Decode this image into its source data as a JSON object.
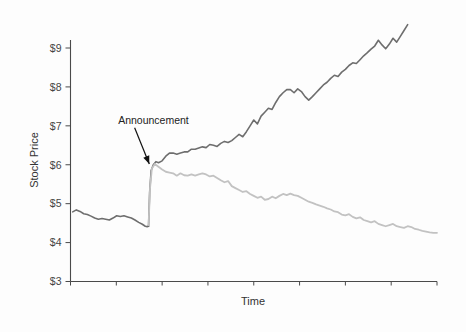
{
  "chart_data": {
    "type": "line",
    "title": "",
    "subtitle": "",
    "xlabel": "Time",
    "ylabel": "Stock Price",
    "ylim": [
      3,
      9.7
    ],
    "xlim": [
      0,
      100
    ],
    "grid": false,
    "legend_position": "none",
    "y_tick_labels": [
      "$3",
      "$4",
      "$5",
      "$6",
      "$7",
      "$8",
      "$9"
    ],
    "y_tick_values": [
      3,
      4,
      5,
      6,
      7,
      8,
      9
    ],
    "x_tick_labels": [
      "",
      "",
      "",
      "",
      "",
      "",
      "",
      "",
      ""
    ],
    "x_tick_values": [
      0,
      12.5,
      25,
      37.5,
      50,
      62.5,
      75,
      87.5,
      100
    ],
    "annotations": [
      {
        "text": "Announcement",
        "text_x": 13.0,
        "text_y": 7.05,
        "arrow_from_x": 17.5,
        "arrow_from_y": 6.95,
        "arrow_to_x": 21.5,
        "arrow_to_y": 6.02
      }
    ],
    "series": [
      {
        "name": "pre-announcement",
        "color": "#6e6e6e",
        "width": 1.6,
        "x": [
          0.6,
          1.6,
          2.6,
          3.6,
          4.6,
          5.6,
          6.6,
          7.6,
          8.6,
          9.6,
          10.6,
          11.6,
          12.6,
          13.6,
          14.6,
          15.6,
          16.6,
          17.6,
          18.6,
          19.6,
          20.4,
          20.9,
          21.3
        ],
        "values": [
          4.79,
          4.84,
          4.8,
          4.74,
          4.72,
          4.68,
          4.63,
          4.6,
          4.62,
          4.6,
          4.58,
          4.63,
          4.69,
          4.67,
          4.69,
          4.66,
          4.63,
          4.58,
          4.52,
          4.47,
          4.42,
          4.41,
          4.42
        ]
      },
      {
        "name": "post-announcement-upper",
        "color": "#6e6e6e",
        "width": 1.6,
        "x": [
          21.3,
          21.6,
          22.0,
          22.6,
          23.3,
          24.0,
          25.0,
          26.0,
          27.0,
          28.0,
          29.0,
          30.0,
          31.0,
          32.0,
          33.0,
          34.0,
          35.0,
          36.0,
          37.0,
          38.0,
          39.0,
          40.0,
          41.0,
          42.0,
          43.0,
          44.0,
          45.0,
          46.0,
          47.0,
          48.0,
          49.0,
          50.0,
          51.0,
          52.0,
          53.0,
          54.0,
          55.0,
          56.0,
          57.0,
          58.0,
          59.0,
          60.0,
          61.0,
          62.0,
          63.0,
          64.0,
          65.0,
          66.0,
          67.0,
          68.0,
          69.0,
          70.0,
          71.0,
          72.0,
          73.0,
          74.0,
          75.0,
          76.0,
          77.0,
          78.0,
          79.0,
          80.0,
          81.0,
          82.0,
          83.0,
          84.0,
          85.0,
          86.0,
          87.0,
          88.0,
          89.0,
          90.0,
          91.0,
          92.0
        ],
        "values": [
          4.42,
          5.3,
          5.85,
          6.0,
          6.08,
          6.05,
          6.1,
          6.22,
          6.3,
          6.3,
          6.27,
          6.3,
          6.33,
          6.33,
          6.4,
          6.4,
          6.43,
          6.46,
          6.44,
          6.52,
          6.5,
          6.47,
          6.55,
          6.6,
          6.57,
          6.62,
          6.7,
          6.78,
          6.72,
          6.85,
          7.0,
          7.15,
          7.05,
          7.25,
          7.35,
          7.45,
          7.42,
          7.6,
          7.75,
          7.85,
          7.93,
          7.93,
          7.85,
          7.95,
          7.88,
          7.75,
          7.66,
          7.75,
          7.85,
          7.95,
          8.05,
          8.12,
          8.22,
          8.3,
          8.27,
          8.38,
          8.45,
          8.55,
          8.62,
          8.6,
          8.7,
          8.8,
          8.88,
          8.97,
          9.05,
          9.2,
          9.08,
          8.98,
          9.1,
          9.25,
          9.15,
          9.3,
          9.45,
          9.6
        ]
      },
      {
        "name": "post-announcement-lower",
        "color": "#c2c2c2",
        "width": 1.8,
        "x": [
          21.3,
          21.7,
          22.2,
          23.0,
          24.0,
          25.0,
          26.0,
          27.0,
          28.0,
          29.0,
          30.0,
          31.0,
          32.0,
          33.0,
          34.0,
          35.0,
          36.0,
          37.0,
          38.0,
          39.0,
          40.0,
          41.0,
          42.0,
          43.0,
          44.0,
          45.0,
          46.0,
          47.0,
          48.0,
          49.0,
          50.0,
          51.0,
          52.0,
          53.0,
          54.0,
          55.0,
          56.0,
          57.0,
          58.0,
          59.0,
          60.0,
          61.0,
          62.0,
          63.0,
          64.0,
          65.0,
          66.0,
          67.0,
          68.0,
          69.0,
          70.0,
          71.0,
          72.0,
          73.0,
          74.0,
          75.0,
          76.0,
          77.0,
          78.0,
          79.0,
          80.0,
          81.0,
          82.0,
          83.0,
          84.0,
          85.0,
          86.0,
          87.0,
          88.0,
          89.0,
          90.0,
          91.0,
          92.0,
          93.0,
          94.0,
          95.0,
          96.0,
          97.0,
          98.0,
          99.0,
          100.0
        ],
        "values": [
          4.45,
          5.4,
          5.9,
          6.02,
          5.95,
          5.88,
          5.82,
          5.8,
          5.78,
          5.72,
          5.78,
          5.73,
          5.72,
          5.75,
          5.72,
          5.75,
          5.78,
          5.75,
          5.7,
          5.72,
          5.66,
          5.6,
          5.55,
          5.58,
          5.45,
          5.4,
          5.35,
          5.3,
          5.32,
          5.25,
          5.2,
          5.15,
          5.18,
          5.1,
          5.12,
          5.18,
          5.14,
          5.2,
          5.25,
          5.22,
          5.26,
          5.22,
          5.2,
          5.15,
          5.1,
          5.05,
          5.02,
          4.98,
          4.95,
          4.92,
          4.88,
          4.85,
          4.8,
          4.78,
          4.72,
          4.7,
          4.73,
          4.66,
          4.62,
          4.65,
          4.58,
          4.55,
          4.52,
          4.55,
          4.48,
          4.45,
          4.42,
          4.45,
          4.48,
          4.42,
          4.4,
          4.38,
          4.42,
          4.4,
          4.35,
          4.33,
          4.3,
          4.28,
          4.26,
          4.25,
          4.25
        ]
      }
    ]
  },
  "axes": {
    "y_axis_name": "Stock Price",
    "x_axis_name": "Time"
  },
  "colors": {
    "dark_line": "#6e6e6e",
    "light_line": "#c2c2c2",
    "axis": "#4a4a4a",
    "text": "#333333",
    "background": "#fdfdfd"
  }
}
